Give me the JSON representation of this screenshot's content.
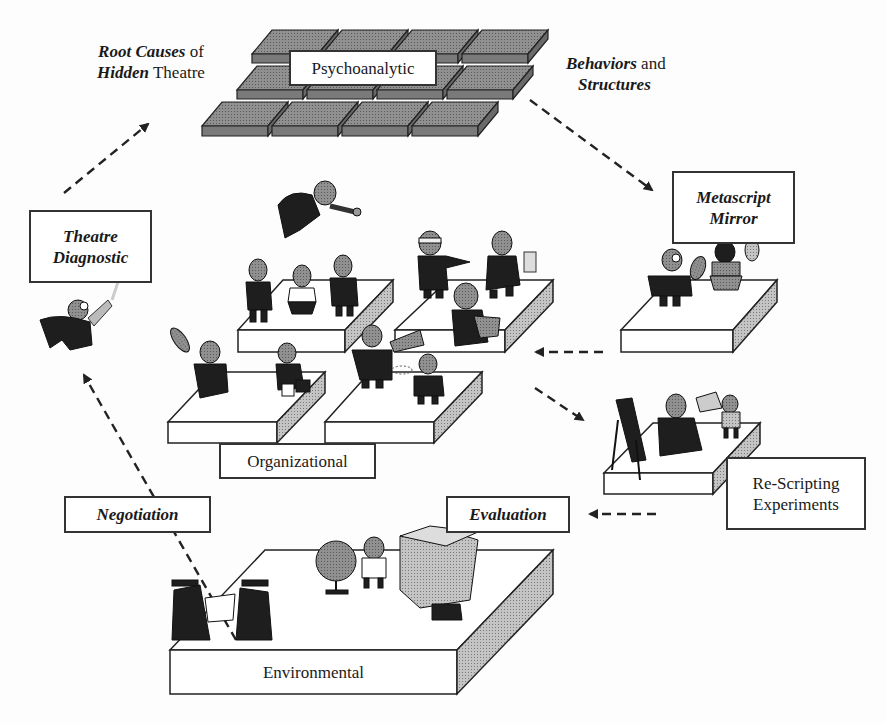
{
  "diagram": {
    "type": "layered conceptual model",
    "colors": {
      "tile_fill": "#8a8a8a",
      "tile_side": "#6e6e6e",
      "platform_side": "#b0b0b0",
      "line": "#222222",
      "background": "#fdfdfd"
    },
    "top_annotation_left": {
      "part1_bi": "Root Causes",
      "part1_rest": " of",
      "part2_bi": "Hidden",
      "part2_rest": " Theatre"
    },
    "top_annotation_right": {
      "part1_bi": "Behaviors",
      "part1_rest": " and",
      "part2_bi": "Structures"
    },
    "layers": {
      "psychoanalytic": "Psychoanalytic",
      "organizational": "Organizational",
      "environmental": "Environmental"
    },
    "process_boxes": {
      "theatre_diagnostic": {
        "line1": "Theatre",
        "line2": "Diagnostic"
      },
      "metascript_mirror": {
        "line1": "Metascript",
        "line2": "Mirror"
      },
      "re_scripting": {
        "line1": "Re-Scripting",
        "line2": "Experiments"
      },
      "evaluation": "Evaluation",
      "negotiation": "Negotiation"
    },
    "flow": [
      "Theatre Diagnostic → Psychoanalytic (Root Causes of Hidden Theatre)",
      "Psychoanalytic → Metascript Mirror (Behaviors and Structures)",
      "Metascript Mirror → Organizational",
      "Organizational → Re-Scripting Experiments",
      "Re-Scripting Experiments → Evaluation",
      "Environmental (Negotiation) → Theatre Diagnostic"
    ],
    "figures": [
      "detective-with-magnifier",
      "flying-superhero",
      "three-staff-figures",
      "blindfolded-figure",
      "windup-toy-figure",
      "figure-with-plug",
      "figure-with-sign",
      "figure-with-briefcase",
      "figure-with-megaphone",
      "confused-figure",
      "figure-with-magnifier",
      "figure-with-mirror",
      "artist-easel",
      "seated-figure",
      "figure-with-cards",
      "graduates-with-scroll",
      "child-with-globe",
      "figure-carrying-box"
    ]
  }
}
